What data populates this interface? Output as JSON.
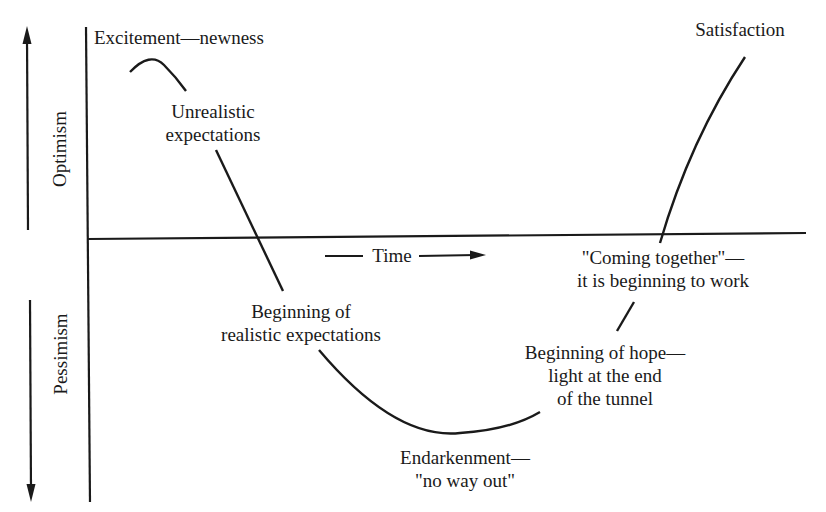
{
  "diagram": {
    "type": "emotional-cycle-of-change",
    "axes": {
      "y_up_label": "Optimism",
      "y_down_label": "Pessimism",
      "x_label": "—Time——→",
      "x_label_text": "Time"
    },
    "stages": [
      {
        "id": "excitement",
        "lines": [
          "Excitement—newness"
        ]
      },
      {
        "id": "unrealistic",
        "lines": [
          "Unrealistic",
          "expectations"
        ]
      },
      {
        "id": "realistic",
        "lines": [
          "Beginning of",
          "realistic expectations"
        ]
      },
      {
        "id": "endarkenment",
        "lines": [
          "Endarkenment—",
          "\"no way out\""
        ]
      },
      {
        "id": "hope",
        "lines": [
          "Beginning of hope—",
          "light at the end",
          "of the tunnel"
        ]
      },
      {
        "id": "coming-together",
        "lines": [
          "\"Coming together\"—",
          "it is beginning to work"
        ]
      },
      {
        "id": "satisfaction",
        "lines": [
          "Satisfaction"
        ]
      }
    ],
    "colors": {
      "ink": "#1a1a1a",
      "background": "#ffffff"
    }
  }
}
